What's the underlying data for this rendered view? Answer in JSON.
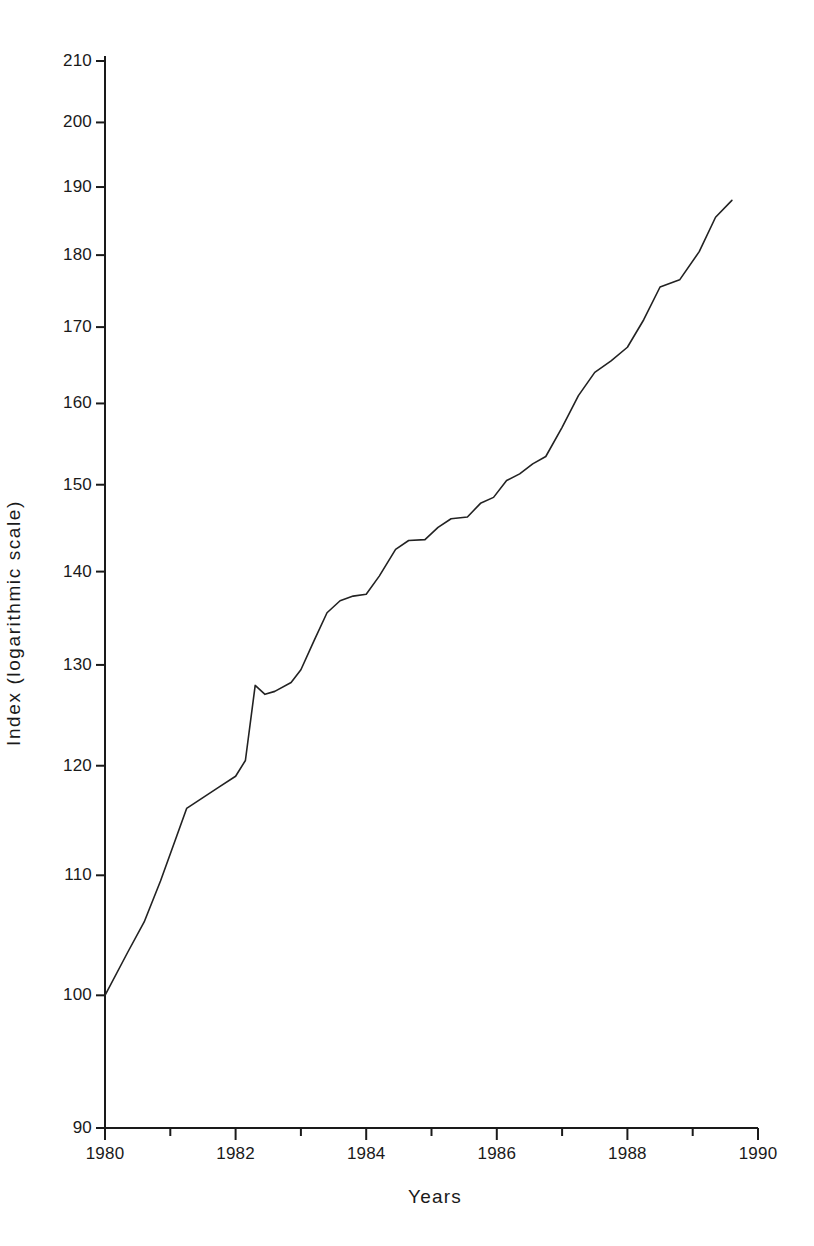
{
  "chart_data": {
    "type": "line",
    "title": "",
    "subtitle": "",
    "xlabel": "Years",
    "ylabel": "Index (logarithmic scale)",
    "yscale": "log",
    "xscale": "linear",
    "xlim": [
      1980,
      1990
    ],
    "ylim": [
      90,
      210
    ],
    "grid": false,
    "legend": false,
    "legend_position": "none",
    "x_ticks": [
      1980,
      1981,
      1982,
      1983,
      1984,
      1985,
      1986,
      1987,
      1988,
      1989,
      1990
    ],
    "x_tick_labels": [
      "1980",
      "",
      "1982",
      "",
      "1984",
      "",
      "1986",
      "",
      "1988",
      "",
      "1990"
    ],
    "x_major_ticks": [
      1980,
      1982,
      1984,
      1986,
      1988,
      1990
    ],
    "x_major_tick_labels": [
      "1980",
      "1982",
      "1984",
      "1986",
      "1988",
      "1990"
    ],
    "y_ticks": [
      90,
      100,
      110,
      120,
      130,
      140,
      150,
      160,
      170,
      180,
      190,
      200,
      210
    ],
    "y_tick_labels": [
      "90",
      "100",
      "110",
      "120",
      "130",
      "140",
      "150",
      "160",
      "170",
      "180",
      "190",
      "200",
      "210"
    ],
    "series": [
      {
        "name": "Index",
        "color": "#222222",
        "line_width": 1.6,
        "x": [
          1980.0,
          1980.35,
          1980.6,
          1980.85,
          1981.1,
          1981.25,
          1981.5,
          1981.75,
          1982.0,
          1982.15,
          1982.3,
          1982.45,
          1982.6,
          1982.85,
          1983.0,
          1983.2,
          1983.4,
          1983.6,
          1983.8,
          1984.0,
          1984.2,
          1984.45,
          1984.65,
          1984.9,
          1985.1,
          1985.3,
          1985.55,
          1985.75,
          1985.95,
          1986.15,
          1986.35,
          1986.55,
          1986.75,
          1987.0,
          1987.25,
          1987.5,
          1987.75,
          1988.0,
          1988.25,
          1988.5,
          1988.8,
          1989.1,
          1989.35,
          1989.6
        ],
        "y": [
          100.0,
          103.5,
          106.0,
          109.5,
          113.5,
          116.0,
          117.0,
          118.0,
          119.0,
          120.5,
          127.9,
          127.0,
          127.3,
          128.2,
          129.5,
          132.5,
          135.5,
          136.8,
          137.3,
          137.5,
          139.5,
          142.5,
          143.5,
          143.6,
          145.0,
          146.0,
          146.2,
          147.8,
          148.5,
          150.5,
          151.3,
          152.5,
          153.4,
          157.0,
          161.0,
          164.0,
          165.5,
          167.3,
          171.0,
          175.5,
          176.5,
          180.5,
          185.5,
          188.0
        ]
      }
    ],
    "annotations": [],
    "data_note": "Monotonically rising index on a logarithmic y-axis, from 100 in 1980 to about 188 in late 1989, with visible step-like plateaus."
  },
  "axes": {
    "y_axis_title": "Index (logarithmic scale)",
    "x_axis_title": "Years"
  }
}
